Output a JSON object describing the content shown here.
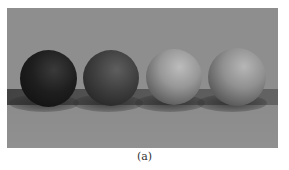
{
  "figure": {
    "background_color": "#8e8e8e",
    "caption": "(a)",
    "spheres": [
      {
        "label": "sphere-1",
        "shade": "black",
        "highlight": "#3a3a3a",
        "base": "#1e1e1e",
        "edge": "#0d0d0d"
      },
      {
        "label": "sphere-2",
        "shade": "dark-gray",
        "highlight": "#5e5e5e",
        "base": "#3e3e3e",
        "edge": "#1c1c1c"
      },
      {
        "label": "sphere-3",
        "shade": "light-gray",
        "highlight": "#b8b8b8",
        "base": "#8f8f8f",
        "edge": "#3a3a3a"
      },
      {
        "label": "sphere-4",
        "shade": "light-gray",
        "highlight": "#b4b4b4",
        "base": "#8a8a8a",
        "edge": "#353535"
      }
    ]
  }
}
